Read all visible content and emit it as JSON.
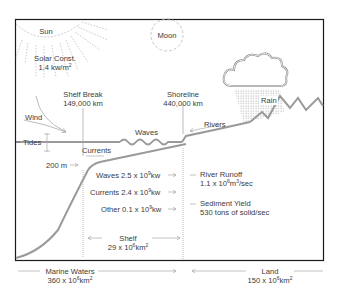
{
  "diagram": {
    "title": "",
    "celestial": {
      "sun": "Sun",
      "solar_constant_label": "Solar Const.",
      "solar_constant_value": "1.4 kw/m",
      "solar_constant_exp": "2",
      "moon": "Moon"
    },
    "boundaries": {
      "shelf_break_label": "Shelf Break",
      "shelf_break_value": "149,000 km",
      "shoreline_label": "Shoreline",
      "shoreline_value": "440,000 km"
    },
    "processes": {
      "wind": "Wind",
      "tides": "Tides",
      "waves": "Waves",
      "currents": "Currents",
      "rivers": "Rivers",
      "rain": "Rain",
      "depth": "200 m"
    },
    "energy": [
      {
        "label": "Waves 2.5 x 10",
        "exp": "9",
        "unit": "kw"
      },
      {
        "label": "Currents 2.4 x 10",
        "exp": "9",
        "unit": "kw"
      },
      {
        "label": "Other 0.1 x 10",
        "exp": "9",
        "unit": "kw"
      }
    ],
    "river_runoff": {
      "label": "River Runoff",
      "value": "1.1 x 10",
      "exp": "6",
      "unit": "m",
      "unit_exp": "3",
      "suffix": "/sec"
    },
    "sediment_yield": {
      "label": "Sediment Yield",
      "value": "530 tons of solid/sec"
    },
    "areas": {
      "shelf_label": "Shelf",
      "shelf_value": "29 x 10",
      "shelf_exp": "6",
      "shelf_unit": "km",
      "shelf_unit_exp": "2",
      "marine_label": "Marine Waters",
      "marine_value": "360 x 10",
      "marine_exp": "6",
      "marine_unit": "km",
      "marine_unit_exp": "2",
      "land_label": "Land",
      "land_value": "150 x 10",
      "land_exp": "6",
      "land_unit": "km",
      "land_unit_exp": "2"
    },
    "colors": {
      "border": "#1a1a1a",
      "line": "#9a9a9a",
      "text": "#3a3a3a"
    }
  }
}
